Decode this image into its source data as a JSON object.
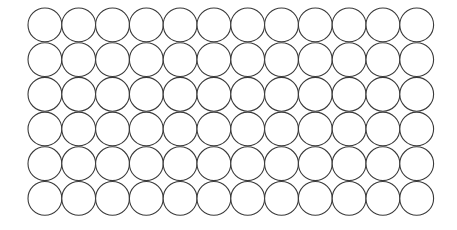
{
  "figure": {
    "kind": "circle-lattice-diagram",
    "background_color": "#ffffff"
  },
  "chart_data": {
    "type": "scatter",
    "title": "",
    "subtitle": "",
    "xlabel": "",
    "ylabel": "",
    "grid": false,
    "legend_position": "none",
    "annotations": [],
    "packing": "square",
    "rows": 6,
    "columns": 12,
    "circle_count": 72,
    "circle_diameter_px": 33.8,
    "circle_radius_px": 16.9,
    "column_spacing_px": 33.8,
    "row_spacing_px": 34.7,
    "origin_x_px": 28,
    "origin_y_px": 8,
    "xlim": [
      28,
      434
    ],
    "ylim": [
      8,
      216
    ],
    "row_labels": [
      "1",
      "2",
      "3",
      "4",
      "5",
      "6"
    ],
    "column_labels": [
      "1",
      "2",
      "3",
      "4",
      "5",
      "6",
      "7",
      "8",
      "9",
      "10",
      "11",
      "12"
    ],
    "series": [
      {
        "name": "circles",
        "marker": "circle-outline",
        "fill_color": "#ffffff",
        "stroke_color": "#3a3a3a",
        "stroke_width_px": 1.1,
        "values": [
          1,
          1,
          1,
          1,
          1,
          1,
          1,
          1,
          1,
          1,
          1,
          1,
          1,
          1,
          1,
          1,
          1,
          1,
          1,
          1,
          1,
          1,
          1,
          1,
          1,
          1,
          1,
          1,
          1,
          1,
          1,
          1,
          1,
          1,
          1,
          1,
          1,
          1,
          1,
          1,
          1,
          1,
          1,
          1,
          1,
          1,
          1,
          1,
          1,
          1,
          1,
          1,
          1,
          1,
          1,
          1,
          1,
          1,
          1,
          1,
          1,
          1,
          1,
          1,
          1,
          1,
          1,
          1,
          1,
          1,
          1,
          1
        ]
      }
    ]
  },
  "colors": {
    "stroke": "#3a3a3a",
    "fill": "#ffffff",
    "background": "#ffffff"
  }
}
